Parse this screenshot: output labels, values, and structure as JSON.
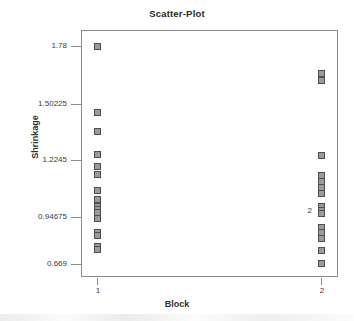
{
  "chart_data": {
    "type": "scatter",
    "title": "Scatter-Plot",
    "xlabel": "Block",
    "ylabel": "Shrinkage",
    "grid": false,
    "legend": false,
    "x_categories": [
      "1",
      "2"
    ],
    "y_ticks": [
      "1.78",
      "1.50225",
      "1.2245",
      "0.94675",
      "0.669"
    ],
    "y_tick_values": [
      1.78,
      1.50225,
      1.2245,
      0.94675,
      0.669
    ],
    "ylim": [
      0.61,
      1.835
    ],
    "marker_color": "#9a9a9a",
    "marker_edge_color": "#4f4f4f",
    "frame_color": "#8d8d8d",
    "series": [
      {
        "name": "Block 1",
        "x_category": "1",
        "values": [
          1.78,
          1.44,
          1.345,
          1.228,
          1.165,
          1.125,
          1.045,
          1.0,
          0.96,
          0.945,
          0.93,
          0.9,
          0.83,
          0.815,
          0.76,
          0.745
        ]
      },
      {
        "name": "Block 2",
        "x_category": "2",
        "values": [
          1.64,
          1.605,
          1.222,
          1.12,
          1.09,
          1.06,
          1.03,
          0.96,
          0.94,
          0.925,
          0.855,
          0.83,
          0.8,
          0.74,
          0.672
        ]
      }
    ],
    "annotations": [
      {
        "text": "2",
        "x_category": "2",
        "y_value": 0.94,
        "meaning": "overlapping-point-count"
      }
    ]
  }
}
